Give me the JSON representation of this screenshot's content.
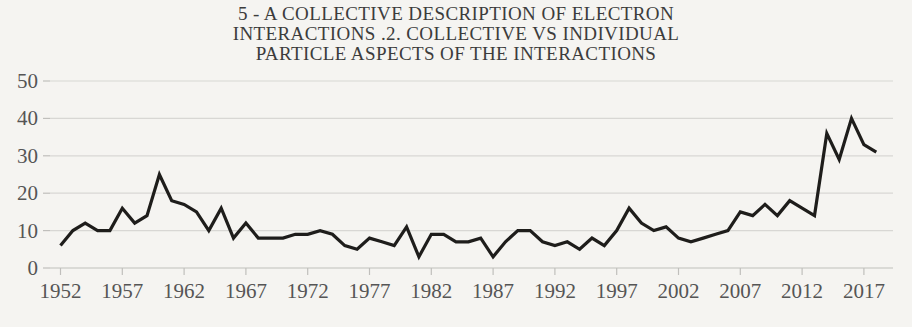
{
  "chart_data": {
    "type": "line",
    "title": "5 - A COLLECTIVE DESCRIPTION OF ELECTRON INTERACTIONS .2. COLLECTIVE VS INDIVIDUAL PARTICLE ASPECTS OF THE INTERACTIONS",
    "title_lines": [
      "5 - A COLLECTIVE DESCRIPTION OF ELECTRON",
      "INTERACTIONS .2. COLLECTIVE VS INDIVIDUAL",
      "PARTICLE ASPECTS OF THE INTERACTIONS"
    ],
    "xlabel": "",
    "ylabel": "",
    "legend": "none",
    "grid": "horizontal",
    "ylim": [
      0,
      50
    ],
    "y_ticks": [
      0,
      10,
      20,
      30,
      40,
      50
    ],
    "x_tick_labels": [
      "1952",
      "1957",
      "1962",
      "1967",
      "1972",
      "1977",
      "1982",
      "1987",
      "1992",
      "1997",
      "2002",
      "2007",
      "2012",
      "2017"
    ],
    "years": [
      1952,
      1953,
      1954,
      1955,
      1956,
      1957,
      1958,
      1959,
      1960,
      1961,
      1962,
      1963,
      1964,
      1965,
      1966,
      1967,
      1968,
      1969,
      1970,
      1971,
      1972,
      1973,
      1974,
      1975,
      1976,
      1977,
      1978,
      1979,
      1980,
      1981,
      1982,
      1983,
      1984,
      1985,
      1986,
      1987,
      1988,
      1989,
      1990,
      1991,
      1992,
      1993,
      1994,
      1995,
      1996,
      1997,
      1998,
      1999,
      2000,
      2001,
      2002,
      2003,
      2004,
      2005,
      2006,
      2007,
      2008,
      2009,
      2010,
      2011,
      2012,
      2013,
      2014,
      2015,
      2016,
      2017,
      2018
    ],
    "values": [
      6,
      10,
      12,
      10,
      10,
      16,
      12,
      14,
      25,
      18,
      17,
      15,
      10,
      16,
      8,
      12,
      8,
      8,
      8,
      9,
      9,
      10,
      9,
      6,
      5,
      8,
      7,
      6,
      11,
      3,
      9,
      9,
      7,
      7,
      8,
      3,
      7,
      10,
      10,
      7,
      6,
      7,
      5,
      8,
      6,
      10,
      16,
      12,
      10,
      11,
      8,
      7,
      8,
      9,
      10,
      15,
      14,
      17,
      14,
      18,
      16,
      14,
      36,
      29,
      40,
      33,
      31
    ],
    "colors": {
      "line": "#1e1d1b",
      "grid": "#d8d7d4",
      "axis": "#c0bfbc",
      "tick_label": "#555555",
      "title": "#3c3c3c",
      "background": "#f5f4f1"
    }
  }
}
